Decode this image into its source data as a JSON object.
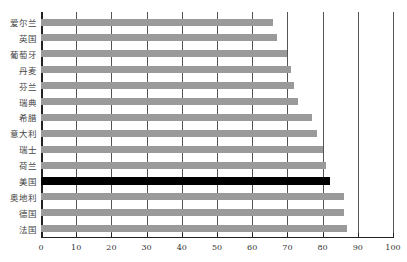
{
  "chart_data": {
    "type": "bar",
    "orientation": "horizontal",
    "title": "",
    "xlabel": "",
    "ylabel": "",
    "xlim": [
      0,
      100
    ],
    "x_ticks": [
      0,
      10,
      20,
      30,
      40,
      50,
      60,
      70,
      80,
      90,
      100
    ],
    "grid": "vertical",
    "legend": null,
    "categories": [
      "爱尔兰",
      "英国",
      "葡萄牙",
      "丹麦",
      "芬兰",
      "瑞典",
      "希腊",
      "意大利",
      "瑞士",
      "荷兰",
      "美国",
      "奥地利",
      "德国",
      "法国"
    ],
    "values": [
      66,
      67,
      70,
      71,
      72,
      73,
      77,
      78.5,
      80,
      81,
      82,
      86,
      86,
      87
    ],
    "highlight": "美国",
    "colors": {
      "bar": "#9a9a9a",
      "highlight": "#000000",
      "grid": "#555555"
    }
  }
}
